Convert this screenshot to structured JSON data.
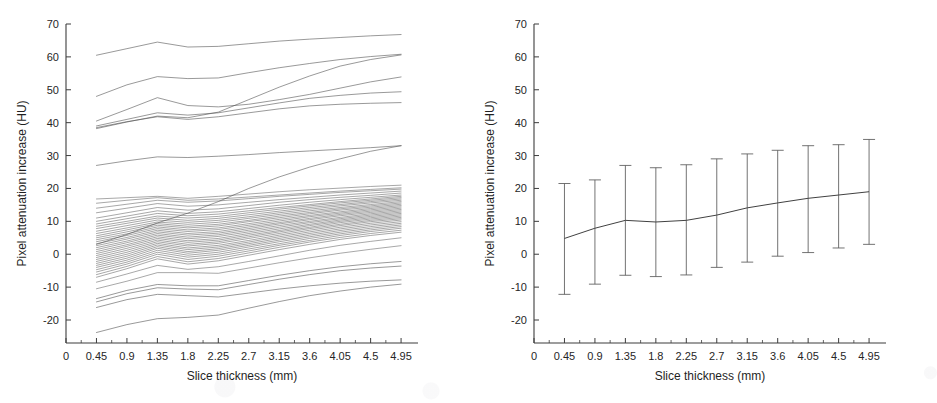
{
  "figure": {
    "background": "#ffffff",
    "ink_color": "#4a4a4a"
  },
  "chart_data": [
    {
      "panel": "left",
      "type": "line",
      "title": "",
      "xlabel": "Slice thickness (mm)",
      "ylabel": "Pixel attenuation increase (HU)",
      "xlim": [
        0,
        5.2
      ],
      "ylim": [
        -24,
        70
      ],
      "grid": false,
      "legend": "none",
      "xticks": [
        0,
        0.45,
        0.9,
        1.35,
        1.8,
        2.25,
        2.7,
        3.15,
        3.6,
        4.05,
        4.5,
        4.95
      ],
      "xticklabels": [
        "0",
        "0.45",
        "0.9",
        "1.35",
        "1.8",
        "2.25",
        "2.7",
        "3.15",
        "3.6",
        "4.05",
        "4.5",
        "4.95"
      ],
      "yticks": [
        -20,
        -10,
        0,
        10,
        20,
        30,
        40,
        50,
        60,
        70
      ],
      "yticklabels": [
        "-20",
        "-10",
        "0",
        "10",
        "20",
        "30",
        "40",
        "50",
        "60",
        "70"
      ],
      "x": [
        0.45,
        0.9,
        1.35,
        1.8,
        2.25,
        2.7,
        3.15,
        3.6,
        4.05,
        4.5,
        4.95
      ],
      "series": [
        {
          "name": "subject-01",
          "values": [
            60.5,
            62.5,
            64.5,
            63.0,
            63.2,
            64.0,
            64.8,
            65.4,
            65.9,
            66.4,
            66.8
          ]
        },
        {
          "name": "subject-02",
          "values": [
            48.0,
            51.5,
            54.0,
            53.4,
            53.6,
            55.2,
            56.7,
            58.0,
            59.2,
            60.1,
            60.8
          ]
        },
        {
          "name": "subject-03",
          "values": [
            38.2,
            40.2,
            42.0,
            41.5,
            43.2,
            47.0,
            50.8,
            54.2,
            57.2,
            59.2,
            60.6
          ]
        },
        {
          "name": "subject-04",
          "values": [
            40.5,
            44.0,
            47.6,
            45.2,
            44.8,
            45.6,
            47.0,
            48.6,
            50.5,
            52.4,
            53.9
          ]
        },
        {
          "name": "subject-05",
          "values": [
            39.0,
            41.0,
            43.0,
            42.3,
            43.0,
            44.5,
            46.0,
            47.4,
            48.3,
            49.0,
            49.4
          ]
        },
        {
          "name": "subject-06",
          "values": [
            38.5,
            40.3,
            41.8,
            41.0,
            41.8,
            43.0,
            44.2,
            45.1,
            45.6,
            45.9,
            46.1
          ]
        },
        {
          "name": "subject-07",
          "values": [
            27.0,
            28.4,
            29.6,
            29.4,
            29.8,
            30.3,
            30.9,
            31.4,
            31.9,
            32.4,
            33.0
          ]
        },
        {
          "name": "subject-08",
          "values": [
            3.0,
            6.0,
            9.5,
            12.5,
            16.0,
            20.0,
            23.5,
            26.5,
            29.0,
            31.3,
            33.0
          ]
        },
        {
          "name": "subject-09",
          "values": [
            16.8,
            17.2,
            17.6,
            17.0,
            17.6,
            18.3,
            19.0,
            19.6,
            20.1,
            20.6,
            21.0
          ]
        },
        {
          "name": "subject-10",
          "values": [
            15.5,
            16.4,
            17.2,
            16.4,
            16.8,
            17.4,
            18.0,
            18.6,
            19.2,
            19.7,
            20.2
          ]
        },
        {
          "name": "subject-11",
          "values": [
            14.0,
            15.2,
            16.4,
            15.8,
            16.2,
            16.9,
            17.6,
            18.2,
            18.8,
            19.3,
            19.8
          ]
        },
        {
          "name": "subject-12",
          "values": [
            12.6,
            14.0,
            15.4,
            14.6,
            15.0,
            15.8,
            16.6,
            17.3,
            18.0,
            18.6,
            19.2
          ]
        },
        {
          "name": "subject-13",
          "values": [
            11.0,
            12.6,
            14.2,
            13.4,
            13.8,
            14.8,
            15.8,
            16.6,
            17.3,
            17.9,
            18.6
          ]
        },
        {
          "name": "subject-14",
          "values": [
            10.0,
            11.6,
            13.2,
            12.4,
            12.9,
            13.9,
            14.9,
            15.8,
            16.6,
            17.3,
            18.0
          ]
        },
        {
          "name": "subject-15",
          "values": [
            9.2,
            10.8,
            12.4,
            11.7,
            12.2,
            13.2,
            14.2,
            15.1,
            16.0,
            16.8,
            17.6
          ]
        },
        {
          "name": "subject-16",
          "values": [
            8.5,
            10.0,
            11.6,
            11.0,
            11.5,
            12.6,
            13.7,
            14.7,
            15.6,
            16.4,
            17.2
          ]
        },
        {
          "name": "subject-17",
          "values": [
            7.8,
            9.4,
            11.0,
            10.3,
            10.9,
            12.0,
            13.1,
            14.2,
            15.1,
            16.0,
            16.8
          ]
        },
        {
          "name": "subject-18",
          "values": [
            7.0,
            8.7,
            10.4,
            9.7,
            10.3,
            11.4,
            12.6,
            13.7,
            14.7,
            15.6,
            16.4
          ]
        },
        {
          "name": "subject-19",
          "values": [
            6.3,
            8.0,
            9.8,
            9.1,
            9.7,
            10.9,
            12.1,
            13.2,
            14.2,
            15.1,
            16.0
          ]
        },
        {
          "name": "subject-20",
          "values": [
            5.6,
            7.4,
            9.3,
            8.5,
            9.1,
            10.3,
            11.6,
            12.7,
            13.8,
            14.7,
            15.6
          ]
        },
        {
          "name": "subject-21",
          "values": [
            5.0,
            6.8,
            8.8,
            8.0,
            8.6,
            9.9,
            11.1,
            12.3,
            13.4,
            14.3,
            15.2
          ]
        },
        {
          "name": "subject-22",
          "values": [
            4.4,
            6.2,
            8.3,
            7.4,
            8.0,
            9.3,
            10.6,
            11.8,
            12.9,
            13.9,
            14.8
          ]
        },
        {
          "name": "subject-23",
          "values": [
            3.8,
            5.7,
            7.8,
            6.9,
            7.5,
            8.8,
            10.1,
            11.4,
            12.5,
            13.5,
            14.4
          ]
        },
        {
          "name": "subject-24",
          "values": [
            3.2,
            5.1,
            7.3,
            6.3,
            6.9,
            8.3,
            9.6,
            10.9,
            12.1,
            13.1,
            14.0
          ]
        },
        {
          "name": "subject-25",
          "values": [
            2.6,
            4.6,
            6.8,
            5.8,
            6.4,
            7.8,
            9.2,
            10.5,
            11.7,
            12.7,
            13.6
          ]
        },
        {
          "name": "subject-26",
          "values": [
            2.0,
            4.0,
            6.3,
            5.2,
            5.9,
            7.3,
            8.7,
            10.0,
            11.2,
            12.3,
            13.2
          ]
        },
        {
          "name": "subject-27",
          "values": [
            1.4,
            3.5,
            5.8,
            4.7,
            5.4,
            6.8,
            8.2,
            9.6,
            10.8,
            11.9,
            12.8
          ]
        },
        {
          "name": "subject-28",
          "values": [
            0.8,
            2.9,
            5.3,
            4.1,
            4.8,
            6.3,
            7.7,
            9.1,
            10.4,
            11.5,
            12.4
          ]
        },
        {
          "name": "subject-29",
          "values": [
            0.2,
            2.4,
            4.8,
            3.6,
            4.3,
            5.8,
            7.2,
            8.7,
            10.0,
            11.1,
            12.0
          ]
        },
        {
          "name": "subject-30",
          "values": [
            -0.4,
            1.8,
            4.3,
            3.0,
            3.8,
            5.3,
            6.8,
            8.2,
            9.6,
            10.7,
            11.6
          ]
        },
        {
          "name": "subject-31",
          "values": [
            -1.0,
            1.2,
            3.8,
            2.5,
            3.3,
            4.8,
            6.3,
            7.8,
            9.1,
            10.3,
            11.2
          ]
        },
        {
          "name": "subject-32",
          "values": [
            -1.6,
            0.6,
            3.3,
            1.9,
            2.7,
            4.2,
            5.8,
            7.3,
            8.7,
            9.9,
            10.8
          ]
        },
        {
          "name": "subject-33",
          "values": [
            -2.2,
            0.0,
            2.8,
            1.4,
            2.2,
            3.7,
            5.3,
            6.8,
            8.2,
            9.4,
            10.4
          ]
        },
        {
          "name": "subject-34",
          "values": [
            -2.8,
            -0.6,
            2.3,
            0.8,
            1.7,
            3.2,
            4.8,
            6.3,
            7.7,
            8.9,
            9.9
          ]
        },
        {
          "name": "subject-35",
          "values": [
            -3.4,
            -1.2,
            1.8,
            0.3,
            1.2,
            2.7,
            4.3,
            5.8,
            7.2,
            8.4,
            9.4
          ]
        },
        {
          "name": "subject-36",
          "values": [
            -4.0,
            -1.8,
            1.2,
            -0.3,
            0.6,
            2.2,
            3.8,
            5.3,
            6.7,
            7.9,
            8.9
          ]
        },
        {
          "name": "subject-37",
          "values": [
            -4.7,
            -2.4,
            0.6,
            -0.9,
            0.0,
            1.6,
            3.2,
            4.8,
            6.2,
            7.4,
            8.4
          ]
        },
        {
          "name": "subject-38",
          "values": [
            -5.4,
            -3.0,
            0.0,
            -1.6,
            -0.6,
            1.0,
            2.7,
            4.2,
            5.7,
            6.9,
            7.9
          ]
        },
        {
          "name": "subject-39",
          "values": [
            -6.2,
            -3.7,
            -0.7,
            -2.3,
            -1.3,
            0.4,
            2.1,
            3.7,
            5.1,
            6.3,
            7.3
          ]
        },
        {
          "name": "subject-40",
          "values": [
            -7.0,
            -4.4,
            -1.4,
            -3.0,
            -2.0,
            -0.3,
            1.4,
            3.0,
            4.5,
            5.7,
            6.7
          ]
        },
        {
          "name": "subject-41",
          "values": [
            -8.5,
            -6.0,
            -3.4,
            -4.6,
            -3.8,
            -2.2,
            -0.5,
            1.2,
            2.7,
            3.9,
            5.0
          ]
        },
        {
          "name": "subject-42",
          "values": [
            -10.5,
            -8.2,
            -5.6,
            -5.6,
            -5.8,
            -4.2,
            -2.6,
            -1.1,
            0.3,
            1.5,
            2.6
          ]
        },
        {
          "name": "subject-43",
          "values": [
            -13.5,
            -11.0,
            -9.2,
            -9.6,
            -9.6,
            -8.0,
            -6.4,
            -5.0,
            -3.8,
            -2.9,
            -2.2
          ]
        },
        {
          "name": "subject-44",
          "values": [
            -14.5,
            -12.0,
            -10.2,
            -10.6,
            -10.8,
            -9.2,
            -7.6,
            -6.2,
            -5.0,
            -4.2,
            -3.6
          ]
        },
        {
          "name": "subject-45",
          "values": [
            -16.2,
            -13.8,
            -12.2,
            -12.6,
            -13.0,
            -11.8,
            -10.6,
            -9.6,
            -8.8,
            -8.2,
            -7.8
          ]
        },
        {
          "name": "subject-46",
          "values": [
            -23.8,
            -21.4,
            -19.6,
            -19.2,
            -18.5,
            -16.4,
            -14.4,
            -12.6,
            -11.2,
            -10.0,
            -9.1
          ]
        }
      ]
    },
    {
      "panel": "right",
      "type": "line",
      "title": "",
      "xlabel": "Slice thickness (mm)",
      "ylabel": "Pixel attenuation increase (HU)",
      "xlim": [
        0,
        5.2
      ],
      "ylim": [
        -24,
        70
      ],
      "grid": false,
      "legend": "none",
      "errorbars": true,
      "xticks": [
        0,
        0.45,
        0.9,
        1.35,
        1.8,
        2.25,
        2.7,
        3.15,
        3.6,
        4.05,
        4.5,
        4.95
      ],
      "xticklabels": [
        "0",
        "0.45",
        "0.9",
        "1.35",
        "1.8",
        "2.25",
        "2.7",
        "3.15",
        "3.6",
        "4.05",
        "4.5",
        "4.95"
      ],
      "yticks": [
        -20,
        -10,
        0,
        10,
        20,
        30,
        40,
        50,
        60,
        70
      ],
      "yticklabels": [
        "-20",
        "-10",
        "0",
        "10",
        "20",
        "30",
        "40",
        "50",
        "60",
        "70"
      ],
      "x": [
        0.45,
        0.9,
        1.35,
        1.8,
        2.25,
        2.7,
        3.15,
        3.6,
        4.05,
        4.5,
        4.95
      ],
      "mean": [
        4.8,
        7.9,
        10.3,
        9.8,
        10.3,
        11.9,
        14.1,
        15.6,
        17.0,
        18.0,
        19.0
      ],
      "upper": [
        21.5,
        22.6,
        27.0,
        26.3,
        27.2,
        29.0,
        30.5,
        31.6,
        33.0,
        33.3,
        34.9
      ],
      "lower": [
        -12.2,
        -9.1,
        -6.4,
        -6.8,
        -6.3,
        -4.0,
        -2.4,
        -0.6,
        0.5,
        1.9,
        3.0
      ],
      "err_up": [
        16.7,
        14.7,
        16.7,
        16.5,
        16.9,
        17.1,
        16.4,
        16.0,
        16.0,
        15.3,
        15.9
      ],
      "err_down": [
        17.0,
        17.0,
        16.7,
        16.6,
        16.6,
        15.9,
        16.5,
        16.2,
        16.5,
        16.1,
        16.0
      ]
    }
  ]
}
